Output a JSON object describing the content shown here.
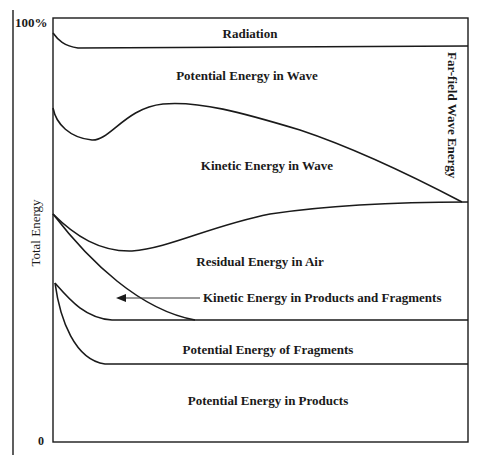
{
  "diagram": {
    "axis": {
      "ylabel": "Total Energy",
      "top_tick": "100%",
      "bottom_tick": "0"
    },
    "regions": [
      {
        "id": "radiation",
        "label": "Radiation"
      },
      {
        "id": "pe-wave",
        "label": "Potential Energy in Wave"
      },
      {
        "id": "ke-wave",
        "label": "Kinetic Energy in Wave"
      },
      {
        "id": "residual-air",
        "label": "Residual Energy in Air"
      },
      {
        "id": "ke-products-fragments",
        "label": "Kinetic Energy in Products and Fragments"
      },
      {
        "id": "pe-fragments",
        "label": "Potential Energy of Fragments"
      },
      {
        "id": "pe-products",
        "label": "Potential Energy in Products"
      }
    ],
    "side_label": "Far-field Wave Energy",
    "colors": {
      "ink": "#1a1a1a",
      "background": "#ffffff"
    }
  }
}
